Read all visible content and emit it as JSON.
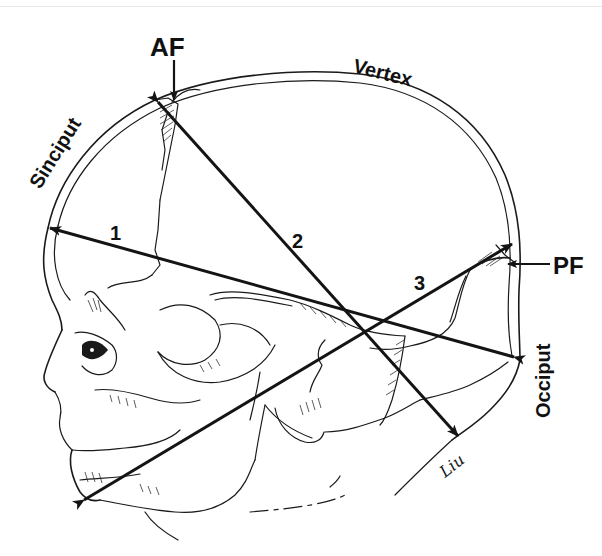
{
  "figure": {
    "labels": {
      "anterior_fontanelle": "AF",
      "posterior_fontanelle": "PF",
      "vertex": "Vertex",
      "sinciput": "Sinciput",
      "occiput": "Occiput",
      "signature": "Liu"
    },
    "diameters": [
      {
        "id": "1",
        "label": "1",
        "from": "Occiput (posterior)",
        "to": "Sinciput (forehead)"
      },
      {
        "id": "2",
        "label": "2",
        "from": "Anterior fontanelle",
        "to": "Suboccipital / nape"
      },
      {
        "id": "3",
        "label": "3",
        "from": "Chin",
        "to": "Posterior fontanelle"
      }
    ],
    "colors": {
      "ink": "#141414",
      "background": "#ffffff"
    }
  }
}
